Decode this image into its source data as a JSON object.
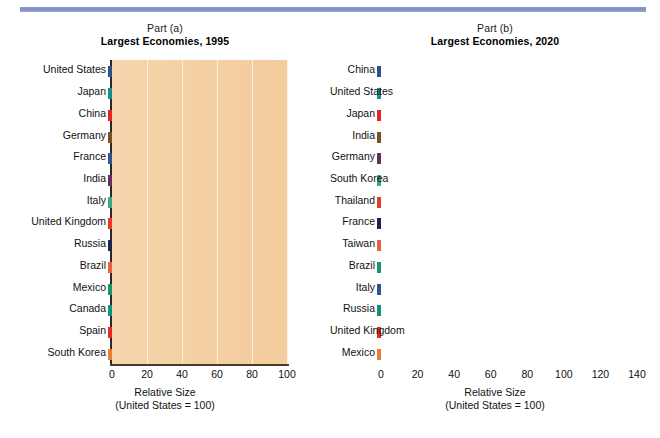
{
  "figure": {
    "background": "#ffffff",
    "rule_color": "#8e9cc8",
    "plot_background": "#f4cfa2"
  },
  "chart_data": [
    {
      "type": "bar",
      "orientation": "horizontal",
      "part": "Part (a)",
      "title": "Largest Economies, 1995",
      "xlabel_line1": "Relative Size",
      "xlabel_line2": "(United States = 100)",
      "ylabel": "",
      "xlim": [
        0,
        100
      ],
      "xticks": [
        0,
        20,
        40,
        60,
        80,
        100
      ],
      "grid": true,
      "legend": "none",
      "categories": [
        "United States",
        "Japan",
        "China",
        "Germany",
        "France",
        "India",
        "Italy",
        "United Kingdom",
        "Russia",
        "Brazil",
        "Mexico",
        "Canada",
        "Spain",
        "South Korea"
      ],
      "values": [
        100,
        41,
        40,
        28,
        20,
        20,
        19,
        16,
        15,
        13,
        12,
        11,
        10,
        9
      ],
      "colors": [
        "#5b79b4",
        "#6fc0b4",
        "#ef7d6e",
        "#a87c4e",
        "#6d86b8",
        "#8e5a80",
        "#86c8ae",
        "#ef8c76",
        "#4f5584",
        "#f0a088",
        "#56b388",
        "#63b9ae",
        "#f08070",
        "#f4a05c"
      ],
      "side_colors": [
        "#2f4f8f",
        "#14918a",
        "#e8241f",
        "#7a5124",
        "#2d5490",
        "#6b2e5c",
        "#3aa987",
        "#ea3a25",
        "#1b2256",
        "#e8613f",
        "#1f9360",
        "#14907f",
        "#e62b1e",
        "#ee7a33"
      ]
    },
    {
      "type": "bar",
      "orientation": "horizontal",
      "part": "Part (b)",
      "title": "Largest Economies, 2020",
      "xlabel_line1": "Relative Size",
      "xlabel_line2": "(United States = 100)",
      "ylabel": "",
      "xlim": [
        0,
        140
      ],
      "xticks": [
        0,
        20,
        40,
        60,
        80,
        100,
        120,
        140
      ],
      "grid": true,
      "legend": "none",
      "categories": [
        "China",
        "United States",
        "Japan",
        "India",
        "Germany",
        "South Korea",
        "Thailand",
        "France",
        "Taiwan",
        "Brazil",
        "Italy",
        "Russia",
        "United Kingdom",
        "Mexico"
      ],
      "values": [
        137,
        100,
        47.5,
        32,
        25,
        21,
        18.5,
        18,
        17.5,
        16,
        15,
        15,
        13,
        12.5
      ],
      "colors": [
        "#5b79b4",
        "#6fc0b4",
        "#ef7d6e",
        "#a87c4e",
        "#8e5a80",
        "#86c8ae",
        "#f08a70",
        "#4f5584",
        "#f08a70",
        "#56b388",
        "#6d86b8",
        "#63b9ae",
        "#f08070",
        "#f4a05c"
      ],
      "side_colors": [
        "#2f4f8f",
        "#14918a",
        "#e8241f",
        "#7a5124",
        "#6b2e5c",
        "#3aa987",
        "#ea3a25",
        "#1b2256",
        "#e8613f",
        "#1f9360",
        "#2d5490",
        "#14907f",
        "#e62b1e",
        "#ee7a33"
      ]
    }
  ]
}
